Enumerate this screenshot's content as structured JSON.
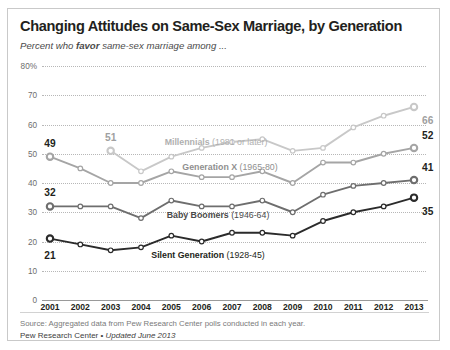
{
  "title": "Changing Attitudes on Same-Sex Marriage, by Generation",
  "subtitle_pre": "Percent who ",
  "subtitle_em": "favor",
  "subtitle_post": " same-sex marriage among ...",
  "source": "Source: Aggregated data from Pew Research Center polls conducted in each year.",
  "footer_brand": "Pew Research Center",
  "footer_sep": " • ",
  "footer_update": "Updated June 2013",
  "chart_data": {
    "type": "line",
    "title": "Changing Attitudes on Same-Sex Marriage, by Generation",
    "subtitle": "Percent who favor same-sex marriage among ...",
    "xlabel": "",
    "ylabel": "Percent who favor",
    "categories": [
      "2001",
      "2002",
      "2003",
      "2004",
      "2005",
      "2006",
      "2007",
      "2008",
      "2009",
      "2010",
      "2011",
      "2012",
      "2013"
    ],
    "ylim": [
      0,
      80
    ],
    "yticks": [
      0,
      10,
      20,
      30,
      40,
      50,
      60,
      70,
      80
    ],
    "ytick_labels": [
      "0",
      "10",
      "20",
      "30",
      "40",
      "50",
      "60",
      "70",
      "80%"
    ],
    "grid": true,
    "legend": "inline-labels",
    "series": [
      {
        "name": "Millennials (1981 or later)",
        "label_name": "Millennials",
        "label_years": "(1981 or later)",
        "color": "#c8c8c8",
        "start_label": "51",
        "end_label": "66",
        "x": [
          "2003",
          "2004",
          "2005",
          "2006",
          "2007",
          "2008",
          "2009",
          "2010",
          "2011",
          "2012",
          "2013"
        ],
        "values": [
          51,
          44,
          49,
          52,
          54,
          55,
          51,
          52,
          59,
          63,
          66
        ]
      },
      {
        "name": "Generation X (1965-80)",
        "label_name": "Generation X",
        "label_years": "(1965-80)",
        "color": "#a5a5a5",
        "start_label": "49",
        "end_label": "52",
        "x": [
          "2001",
          "2002",
          "2003",
          "2004",
          "2005",
          "2006",
          "2007",
          "2008",
          "2009",
          "2010",
          "2011",
          "2012",
          "2013"
        ],
        "values": [
          49,
          45,
          40,
          40,
          44,
          42,
          42,
          44,
          40,
          47,
          47,
          50,
          52
        ]
      },
      {
        "name": "Baby Boomers (1946-64)",
        "label_name": "Baby Boomers",
        "label_years": "(1946-64)",
        "color": "#6e6e6e",
        "start_label": "32",
        "end_label": "41",
        "x": [
          "2001",
          "2002",
          "2003",
          "2004",
          "2005",
          "2006",
          "2007",
          "2008",
          "2009",
          "2010",
          "2011",
          "2012",
          "2013"
        ],
        "values": [
          32,
          32,
          32,
          28,
          34,
          32,
          32,
          34,
          30,
          36,
          39,
          40,
          41
        ]
      },
      {
        "name": "Silent Generation (1928-45)",
        "label_name": "Silent Generation",
        "label_years": "(1928-45)",
        "color": "#2b2b2b",
        "start_label": "21",
        "end_label": "35",
        "x": [
          "2001",
          "2002",
          "2003",
          "2004",
          "2005",
          "2006",
          "2007",
          "2008",
          "2009",
          "2010",
          "2011",
          "2012",
          "2013"
        ],
        "values": [
          21,
          19,
          17,
          18,
          22,
          20,
          23,
          23,
          22,
          27,
          30,
          32,
          35
        ]
      }
    ],
    "start_labels": [
      {
        "series": "Generation X (1965-80)",
        "year": "2001",
        "value": 49,
        "text": "49",
        "color": "#231f20"
      },
      {
        "series": "Baby Boomers (1946-64)",
        "year": "2001",
        "value": 32,
        "text": "32",
        "color": "#231f20"
      },
      {
        "series": "Silent Generation (1928-45)",
        "year": "2001",
        "value": 21,
        "text": "21",
        "color": "#231f20"
      },
      {
        "series": "Millennials (1981 or later)",
        "year": "2003",
        "value": 51,
        "text": "51",
        "color": "#a0a0a0"
      }
    ],
    "end_labels": [
      {
        "series": "Millennials (1981 or later)",
        "value": 66,
        "text": "66",
        "color": "#a0a0a0"
      },
      {
        "series": "Generation X (1965-80)",
        "value": 52,
        "text": "52",
        "color": "#231f20"
      },
      {
        "series": "Baby Boomers (1946-64)",
        "value": 41,
        "text": "41",
        "color": "#231f20"
      },
      {
        "series": "Silent Generation (1928-45)",
        "value": 35,
        "text": "35",
        "color": "#231f20"
      }
    ]
  }
}
